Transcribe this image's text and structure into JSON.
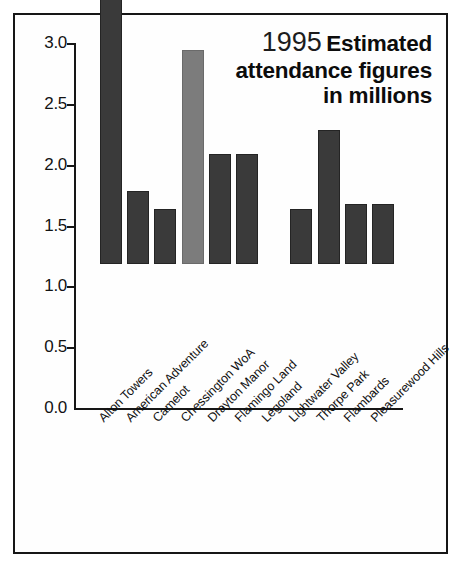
{
  "figure": {
    "title_year": "1995",
    "title_main": "Estimated attendance figures in millions",
    "title_line1": "Estimated",
    "title_line2": "attendance figures",
    "title_line3": "in millions",
    "source_note": "Source: The Tussauds Group estimate",
    "border_color": "#161616",
    "background_color": "#fefefe"
  },
  "chart_data": {
    "type": "bar",
    "title": "1995 Estimated attendance figures in millions",
    "xlabel": "",
    "ylabel": "",
    "ylim": [
      0.0,
      3.0
    ],
    "ytick_labels": [
      "3.0",
      "2.5",
      "2.0",
      "1.5",
      "1.0",
      "0.5",
      "0.0"
    ],
    "ytick_values": [
      3.0,
      2.5,
      2.0,
      1.5,
      1.0,
      0.5,
      0.0
    ],
    "grid": false,
    "legend": null,
    "units": "millions of visitors",
    "categories": [
      "Alton Towers",
      "American Adventure",
      "Camelot",
      "Chessington WoA",
      "Drayton Manor",
      "Flamingo Land",
      "Legoland",
      "Lightwater Valley",
      "Thorpe Park",
      "Flambards",
      "Pleasurewood Hills"
    ],
    "values": [
      2.75,
      0.6,
      0.45,
      1.76,
      0.9,
      0.9,
      0.0,
      0.45,
      1.1,
      0.49,
      0.49
    ],
    "bar_colors": [
      "#3a3a3a",
      "#3a3a3a",
      "#3a3a3a",
      "#7c7c7c",
      "#3a3a3a",
      "#3a3a3a",
      "#3a3a3a",
      "#3a3a3a",
      "#3a3a3a",
      "#3a3a3a",
      "#3a3a3a"
    ],
    "source": "The Tussauds Group estimate"
  }
}
